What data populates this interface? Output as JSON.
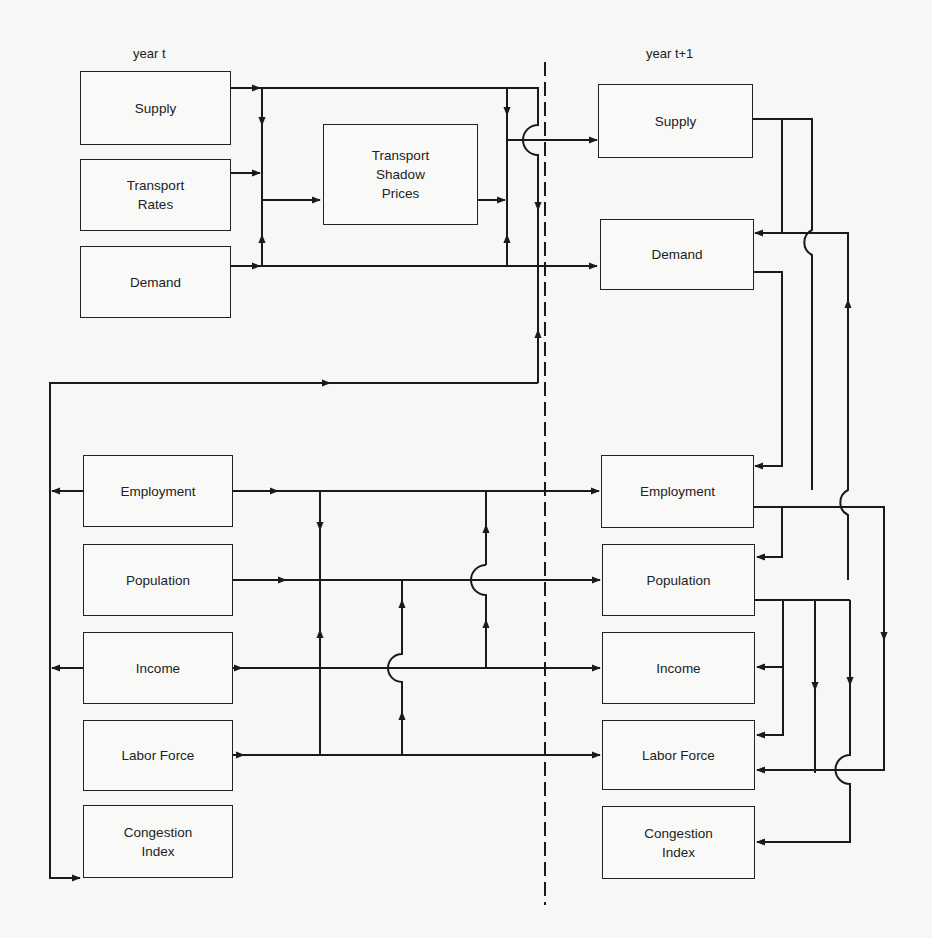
{
  "diagram": {
    "left_column_label": "year t",
    "right_column_label": "year t+1",
    "year_t": {
      "supply": "Supply",
      "transport_rates": "Transport\nRates",
      "demand": "Demand",
      "employment": "Employment",
      "population": "Population",
      "income": "Income",
      "labor_force": "Labor Force",
      "congestion_index": "Congestion\nIndex"
    },
    "middle": {
      "transport_shadow_prices": "Transport\nShadow\nPrices"
    },
    "year_t1": {
      "supply": "Supply",
      "demand": "Demand",
      "employment": "Employment",
      "population": "Population",
      "income": "Income",
      "labor_force": "Labor Force",
      "congestion_index": "Congestion\nIndex"
    },
    "colors": {
      "line": "#1a1a1a",
      "background": "#f7f7f5"
    }
  }
}
